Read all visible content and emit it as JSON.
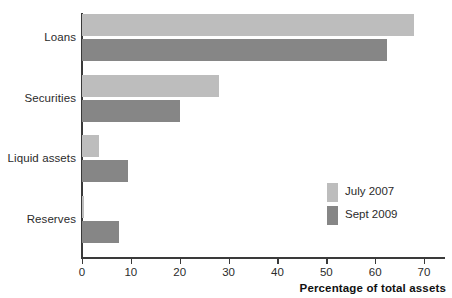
{
  "chart_data": {
    "type": "bar",
    "orientation": "horizontal",
    "title": "",
    "subtitle": "",
    "xlabel": "Percentage of total assets",
    "ylabel": "",
    "xlim": [
      0,
      70
    ],
    "xticks": [
      0,
      10,
      20,
      30,
      40,
      50,
      60,
      70
    ],
    "xtick_labels": [
      "0",
      "10",
      "20",
      "30",
      "40",
      "50",
      "60",
      "70"
    ],
    "grid": false,
    "legend_position": "inside-right",
    "categories": [
      "Loans",
      "Securities",
      "Liquid assets",
      "Reserves"
    ],
    "series": [
      {
        "name": "July 2007",
        "color": "#bdbdbd",
        "values": [
          68,
          28,
          3.5,
          0.5
        ]
      },
      {
        "name": "Sept 2009",
        "color": "#868686",
        "values": [
          62.5,
          20,
          9.5,
          7.5
        ]
      }
    ],
    "axis_color": "#3a3a3a",
    "background": "#ffffff"
  },
  "legend": {
    "items": [
      {
        "label": "July 2007",
        "color": "#bdbdbd"
      },
      {
        "label": "Sept 2009",
        "color": "#868686"
      }
    ]
  },
  "axis": {
    "x_title": "Percentage of total assets"
  }
}
